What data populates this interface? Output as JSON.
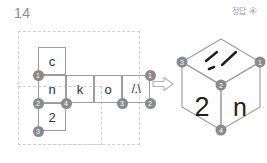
{
  "header": {
    "question_number": "14",
    "answer_label": "정답",
    "answer_value": "④"
  },
  "net": {
    "title": "cube-net",
    "cells": [
      {
        "id": "cell-c",
        "label": "c",
        "col": 0,
        "row": 0
      },
      {
        "id": "cell-n",
        "label": "n",
        "col": 0,
        "row": 1
      },
      {
        "id": "cell-k",
        "label": "k",
        "col": 1,
        "row": 1
      },
      {
        "id": "cell-o",
        "label": "o",
        "col": 2,
        "row": 1
      },
      {
        "id": "cell-slash",
        "label": "/.\\",
        "col": 3,
        "row": 1
      },
      {
        "id": "cell-2",
        "label": "2",
        "col": 0,
        "row": 2
      }
    ],
    "vertices": [
      {
        "id": "net-vtx-1-left",
        "label": "1"
      },
      {
        "id": "net-vtx-1-right",
        "label": "1"
      },
      {
        "id": "net-vtx-2-left",
        "label": "2"
      },
      {
        "id": "net-vtx-2-right",
        "label": "2"
      },
      {
        "id": "net-vtx-3-bottom",
        "label": "3"
      },
      {
        "id": "net-vtx-3-mid",
        "label": "3"
      },
      {
        "id": "net-vtx-4",
        "label": "4"
      }
    ]
  },
  "arrow": {
    "name": "transforms-into-arrow",
    "direction": "right"
  },
  "cube": {
    "left_face_label": "2",
    "right_face_label": "n",
    "top_face_label": "/.\\",
    "vertices": [
      {
        "id": "cube-vtx-3",
        "label": "3"
      },
      {
        "id": "cube-vtx-1",
        "label": "1"
      },
      {
        "id": "cube-vtx-2",
        "label": "2"
      },
      {
        "id": "cube-vtx-4",
        "label": "4"
      }
    ]
  },
  "colors": {
    "line": "#9c9c9c",
    "dashed": "#cfcfcf",
    "vertex_fill": "#8a8a8a",
    "glyph": "#2f2f2f",
    "muted_text": "#9a9a9a"
  }
}
